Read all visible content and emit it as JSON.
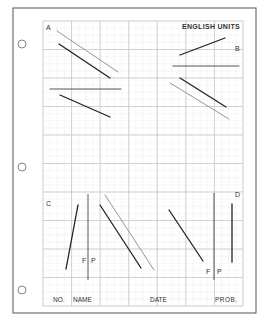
{
  "sheet": {
    "units_label": "ENGLISH UNITS",
    "colors": {
      "border": "#555555",
      "grid_major": "#c8c8c8",
      "grid_minor": "#ececec",
      "line_dark": "#222222",
      "line_light": "#8a8a8a",
      "text": "#333333"
    }
  },
  "binder_holes": [
    {
      "cx": 22,
      "cy": 44
    },
    {
      "cx": 22,
      "cy": 167
    },
    {
      "cx": 22,
      "cy": 290
    }
  ],
  "problems": [
    {
      "label": "A",
      "label_pos": {
        "x": 46,
        "y": 30
      },
      "segments": [
        {
          "x1": 57,
          "y1": 31,
          "x2": 118,
          "y2": 72,
          "tone": "light"
        },
        {
          "x1": 59,
          "y1": 44,
          "x2": 110,
          "y2": 78,
          "tone": "dark"
        },
        {
          "x1": 50,
          "y1": 89,
          "x2": 121,
          "y2": 89,
          "tone": "mid"
        },
        {
          "x1": 60,
          "y1": 95,
          "x2": 110,
          "y2": 117,
          "tone": "dark"
        }
      ]
    },
    {
      "label": "B",
      "label_pos": {
        "x": 235,
        "y": 51
      },
      "segments": [
        {
          "x1": 180,
          "y1": 55,
          "x2": 225,
          "y2": 38,
          "tone": "dark"
        },
        {
          "x1": 173,
          "y1": 66,
          "x2": 239,
          "y2": 66,
          "tone": "mid"
        },
        {
          "x1": 180,
          "y1": 78,
          "x2": 226,
          "y2": 107,
          "tone": "dark"
        },
        {
          "x1": 170,
          "y1": 83,
          "x2": 229,
          "y2": 119,
          "tone": "light"
        }
      ]
    },
    {
      "label": "C",
      "label_pos": {
        "x": 46,
        "y": 206
      },
      "segments": [
        {
          "x1": 78,
          "y1": 205,
          "x2": 66,
          "y2": 269,
          "tone": "dark"
        },
        {
          "x1": 100,
          "y1": 205,
          "x2": 141,
          "y2": 268,
          "tone": "dark"
        },
        {
          "x1": 105,
          "y1": 195,
          "x2": 154,
          "y2": 270,
          "tone": "light"
        }
      ],
      "fp_divider": {
        "x": 88,
        "y1": 194,
        "y2": 280
      },
      "fp_labels": {
        "f": "F",
        "p": "P",
        "f_pos": {
          "x": 82,
          "y": 263
        },
        "p_pos": {
          "x": 91,
          "y": 263
        }
      }
    },
    {
      "label": "D",
      "label_pos": {
        "x": 235,
        "y": 197
      },
      "segments": [
        {
          "x1": 169,
          "y1": 210,
          "x2": 203,
          "y2": 261,
          "tone": "dark"
        },
        {
          "x1": 232,
          "y1": 204,
          "x2": 232,
          "y2": 262,
          "tone": "dark"
        }
      ],
      "fp_divider": {
        "x": 214,
        "y1": 193,
        "y2": 280
      },
      "fp_labels": {
        "f": "F",
        "p": "P",
        "f_pos": {
          "x": 206,
          "y": 274
        },
        "p_pos": {
          "x": 217,
          "y": 274
        }
      }
    }
  ],
  "title_block": {
    "no_label": "NO.",
    "name_label": "NAME",
    "date_label": "DATE",
    "prob_label": "PROB."
  }
}
